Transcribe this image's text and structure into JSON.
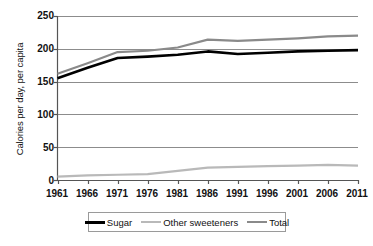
{
  "chart_data": {
    "type": "line",
    "title": "",
    "xlabel": "",
    "ylabel": "Calories per day, per capita",
    "categories": [
      "1961",
      "1966",
      "1971",
      "1976",
      "1981",
      "1986",
      "1991",
      "1996",
      "2001",
      "2006",
      "2011"
    ],
    "x": [
      1961,
      1966,
      1971,
      1976,
      1981,
      1986,
      1991,
      1996,
      2001,
      2006,
      2011
    ],
    "xlim": [
      1961,
      2011
    ],
    "ylim": [
      0,
      250
    ],
    "y_ticks": [
      0,
      50,
      100,
      150,
      200,
      250
    ],
    "y_tick_labels": [
      "0",
      "50",
      "100",
      "150",
      "200",
      "250"
    ],
    "grid": "horizontal",
    "legend_position": "bottom",
    "series": [
      {
        "name": "Sugar",
        "color": "#000000",
        "width": 2.6,
        "values": [
          155,
          171,
          186,
          188,
          191,
          196,
          192,
          194,
          196,
          197,
          198
        ]
      },
      {
        "name": "Other sweeteners",
        "color": "#b9b9b9",
        "width": 2.2,
        "values": [
          5,
          7,
          8,
          9,
          14,
          19,
          20,
          21,
          22,
          23,
          22
        ]
      },
      {
        "name": "Total",
        "color": "#8a8a8a",
        "width": 2.2,
        "values": [
          162,
          178,
          195,
          197,
          202,
          214,
          212,
          214,
          216,
          219,
          220
        ]
      }
    ]
  },
  "legend": {
    "entries": [
      {
        "label": "Sugar"
      },
      {
        "label": "Other sweeteners"
      },
      {
        "label": "Total"
      }
    ]
  },
  "axes": {
    "y_title": "Calories per day, per capita"
  },
  "colors": {
    "axis": "#555555",
    "grid": "#8c8c8c",
    "background": "#ffffff",
    "sugar": "#000000",
    "other_sweeteners": "#b9b9b9",
    "total": "#8a8a8a"
  }
}
